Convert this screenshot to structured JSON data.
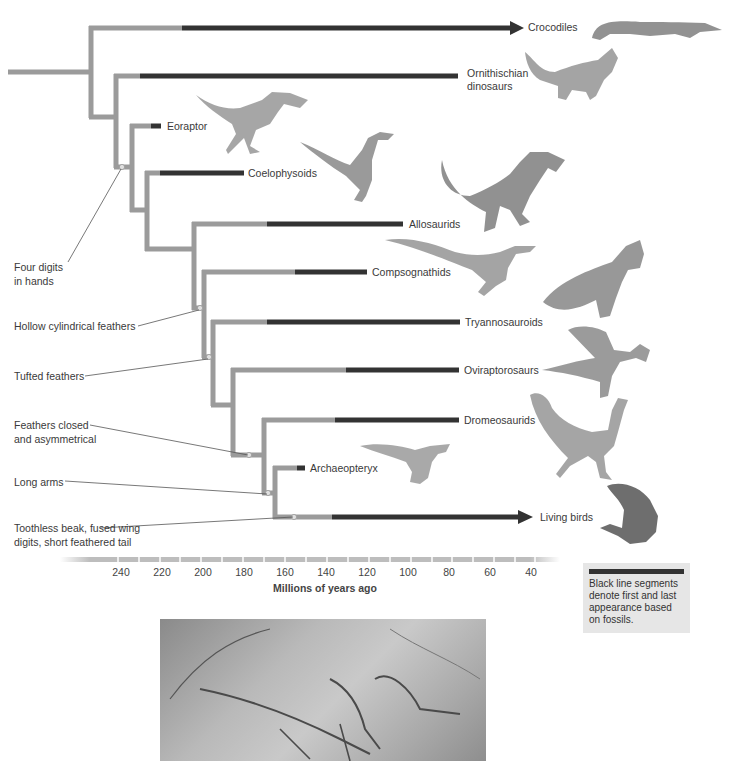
{
  "figure": {
    "type": "phylogenetic-tree",
    "colors": {
      "branch_inferred": "#9b9b9b",
      "branch_fossil_range": "#333333",
      "node_dot": "#d8d8d8",
      "legend_bg": "#e6e6e6"
    },
    "taxa": [
      {
        "label": "Crocodiles",
        "arrow": true
      },
      {
        "label": "Ornithischian",
        "label2": "dinosaurs",
        "arrow": false
      },
      {
        "label": "Eoraptor",
        "arrow": false
      },
      {
        "label": "Coelophysoids",
        "arrow": false
      },
      {
        "label": "Allosaurids",
        "arrow": false
      },
      {
        "label": "Compsognathids",
        "arrow": false
      },
      {
        "label": "Tryannosauroids",
        "arrow": false
      },
      {
        "label": "Oviraptorosaurs",
        "arrow": false
      },
      {
        "label": "Dromeosaurids",
        "arrow": false
      },
      {
        "label": "Archaeopteryx",
        "arrow": false
      },
      {
        "label": "Living birds",
        "arrow": true
      }
    ],
    "traits": [
      {
        "line1": "Four digits",
        "line2": "in hands"
      },
      {
        "line1": "Hollow cylindrical feathers"
      },
      {
        "line1": "Tufted feathers"
      },
      {
        "line1": "Feathers closed",
        "line2": "and asymmetrical"
      },
      {
        "line1": "Long arms"
      },
      {
        "line1": "Toothless beak, fused wing",
        "line2": "digits, short feathered tail"
      }
    ],
    "axis": {
      "ticks": [
        "240",
        "220",
        "200",
        "180",
        "160",
        "140",
        "120",
        "100",
        "80",
        "60",
        "40"
      ],
      "title": "Millions of years ago"
    },
    "legend": {
      "text": "Black line segments denote first and last appearance based on fossils."
    },
    "illustrations": [
      "crocodile",
      "triceratops",
      "eoraptor",
      "coelophysis",
      "allosaurus",
      "compsognathus",
      "tyrannosaurus",
      "oviraptorosaur",
      "dromaeosaur-bird",
      "archaeopteryx-reconstruction",
      "eagle",
      "archaeopteryx-fossil-photo"
    ]
  }
}
